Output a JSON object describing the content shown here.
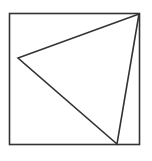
{
  "diagram": {
    "stroke_color": "#333333",
    "background_color": "#ffffff",
    "shapes": [
      {
        "kind": "square",
        "name": "outer-square"
      },
      {
        "kind": "triangle",
        "name": "inscribed-triangle",
        "vertices": [
          "top-right corner of square",
          "left side interior point",
          "bottom side point near right"
        ]
      }
    ]
  }
}
